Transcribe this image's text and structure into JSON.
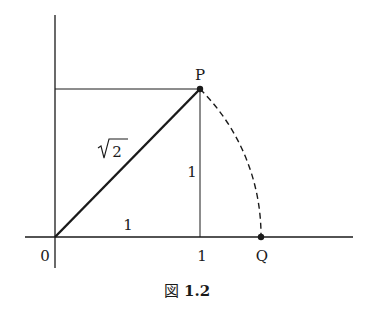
{
  "figure": {
    "caption_prefix": "図",
    "caption_number": "1.2",
    "labels": {
      "origin": "0",
      "x_tick_one": "1",
      "point_p": "P",
      "point_q": "Q",
      "hypotenuse": "2",
      "vertical_side": "1",
      "horizontal_side": "1"
    },
    "colors": {
      "ink": "#1a1a1a",
      "background": "#ffffff"
    }
  }
}
